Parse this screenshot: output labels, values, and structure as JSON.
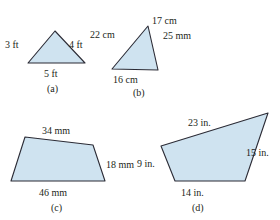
{
  "figure": {
    "background_color": "#ffffff",
    "shape_fill_color": "#cfe3f0",
    "shape_stroke_color": "#2b2b35",
    "text_color": "#231f20"
  },
  "shapes": [
    {
      "id": "a",
      "kind": "triangle",
      "caption": "(a)",
      "points": "55,31 28,63 85,63",
      "labels": [
        {
          "text": "3 ft",
          "x": 5,
          "y": 40,
          "name": "label-a-left"
        },
        {
          "text": "4 ft",
          "x": 69,
          "y": 40,
          "name": "label-a-right"
        },
        {
          "text": "5 ft",
          "x": 44,
          "y": 69,
          "name": "label-a-bottom"
        }
      ],
      "caption_pos": {
        "x": 47,
        "y": 84
      }
    },
    {
      "id": "b",
      "kind": "triangle",
      "caption": "(b)",
      "points": "148,26 112,69 158,70",
      "labels": [
        {
          "text": "22 cm",
          "x": 90,
          "y": 30,
          "name": "label-b-left"
        },
        {
          "text": "17 cm",
          "x": 152,
          "y": 16,
          "name": "label-b-right"
        },
        {
          "text": "25 mm",
          "x": 163,
          "y": 31,
          "name": "label-b-extra"
        },
        {
          "text": "16 cm",
          "x": 113,
          "y": 75,
          "name": "label-b-bottom"
        }
      ],
      "caption_pos": {
        "x": 133,
        "y": 88
      }
    },
    {
      "id": "c",
      "kind": "quadrilateral",
      "caption": "(c)",
      "points": "25,137 93,145 105,181 11,181",
      "labels": [
        {
          "text": "34 mm",
          "x": 42,
          "y": 126,
          "name": "label-c-top"
        },
        {
          "text": "18 mm",
          "x": 106,
          "y": 160,
          "name": "label-c-right"
        },
        {
          "text": "46 mm",
          "x": 39,
          "y": 188,
          "name": "label-c-bottom"
        }
      ],
      "caption_pos": {
        "x": 51,
        "y": 203
      }
    },
    {
      "id": "d",
      "kind": "quadrilateral",
      "caption": "(d)",
      "points": "268,113 161,146 175,181 245,181",
      "labels": [
        {
          "text": "23 in.",
          "x": 188,
          "y": 118,
          "name": "label-d-top"
        },
        {
          "text": "15 in.",
          "x": 246,
          "y": 148,
          "name": "label-d-right"
        },
        {
          "text": "9 in.",
          "x": 137,
          "y": 159,
          "name": "label-d-left"
        },
        {
          "text": "14 in.",
          "x": 181,
          "y": 188,
          "name": "label-d-bottom"
        }
      ],
      "caption_pos": {
        "x": 192,
        "y": 203
      }
    }
  ]
}
